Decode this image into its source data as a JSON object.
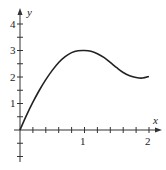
{
  "chart_data": {
    "type": "line",
    "title": "",
    "xlabel": "x",
    "ylabel": "y",
    "xlim": [
      0,
      2.1
    ],
    "ylim": [
      -1.2,
      4.3
    ],
    "x_ticks": [
      0.2,
      0.4,
      0.6,
      0.8,
      1.0,
      1.2,
      1.4,
      1.6,
      1.8,
      2.0
    ],
    "x_tick_labels": {
      "1": "1",
      "2": "2"
    },
    "y_ticks": [
      -1,
      -0.5,
      0.5,
      1,
      1.5,
      2,
      2.5,
      3,
      3.5,
      4
    ],
    "y_tick_labels": {
      "1": "1",
      "2": "2",
      "3": "3",
      "4": "4"
    },
    "grid": false,
    "legend": null,
    "series": [
      {
        "name": "f(x)",
        "x": [
          0,
          0.1,
          0.2,
          0.3,
          0.4,
          0.5,
          0.6,
          0.7,
          0.8,
          0.9,
          1.0,
          1.1,
          1.2,
          1.3,
          1.4,
          1.5,
          1.6,
          1.7,
          1.8,
          1.9,
          2.0
        ],
        "values": [
          0,
          0.55,
          1.05,
          1.5,
          1.9,
          2.25,
          2.55,
          2.77,
          2.92,
          2.99,
          3.0,
          2.97,
          2.88,
          2.74,
          2.55,
          2.35,
          2.17,
          2.05,
          1.98,
          1.96,
          2.02
        ]
      }
    ]
  },
  "labels": {
    "x_axis": "x",
    "y_axis": "y",
    "x1": "1",
    "x2": "2",
    "y1": "1",
    "y2": "2",
    "y3": "3",
    "y4": "4"
  }
}
